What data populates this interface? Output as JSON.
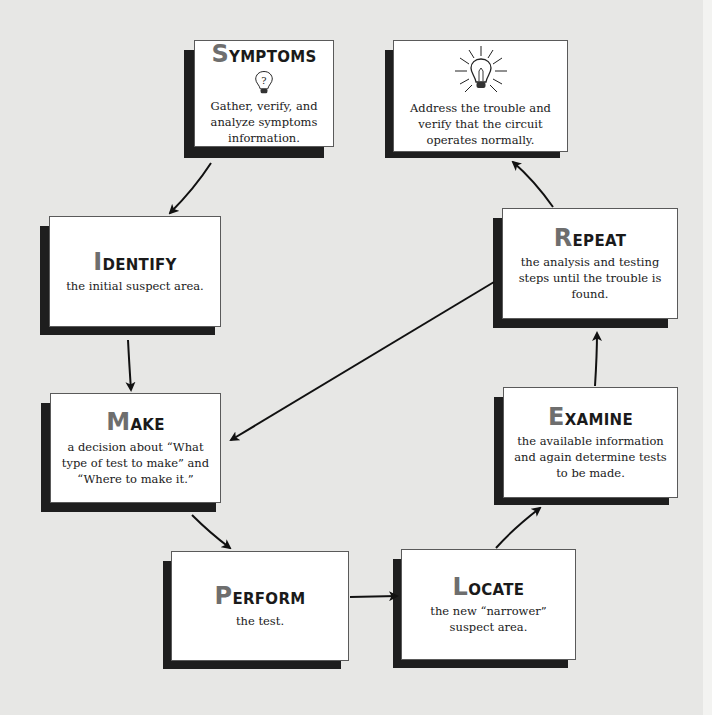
{
  "diagram": {
    "type": "troubleshooting-cycle",
    "colors": {
      "background": "#e7e7e5",
      "box_fill": "#ffffff",
      "box_shadow": "#1e1e1e",
      "title_initial": "#6e6e6e",
      "text": "#1a1a1a",
      "arrow": "#111111"
    },
    "nodes": {
      "symptoms": {
        "title_initial": "S",
        "title_rest": "YMPTOMS",
        "icon": "question-lightbulb-icon",
        "text": "Gather, verify, and analyze symptoms information."
      },
      "resolve": {
        "icon": "glowing-lightbulb-icon",
        "text": "Address the trouble and verify that the circuit operates normally."
      },
      "identify": {
        "title_initial": "I",
        "title_rest": "DENTIFY",
        "text": "the initial suspect area."
      },
      "repeat": {
        "title_initial": "R",
        "title_rest": "EPEAT",
        "text": "the analysis and testing steps until the trouble is found."
      },
      "make": {
        "title_initial": "M",
        "title_rest": "AKE",
        "text": "a decision about “What type of test to make” and “Where to make it.”"
      },
      "examine": {
        "title_initial": "E",
        "title_rest": "XAMINE",
        "text": "the available information and again determine tests to be made."
      },
      "perform": {
        "title_initial": "P",
        "title_rest": "ERFORM",
        "text": "the test."
      },
      "locate": {
        "title_initial": "L",
        "title_rest": "OCATE",
        "text": "the new “narrower” suspect area."
      }
    },
    "edges": [
      {
        "from": "symptoms",
        "to": "identify"
      },
      {
        "from": "identify",
        "to": "make"
      },
      {
        "from": "make",
        "to": "perform"
      },
      {
        "from": "perform",
        "to": "locate"
      },
      {
        "from": "locate",
        "to": "examine"
      },
      {
        "from": "examine",
        "to": "repeat"
      },
      {
        "from": "repeat",
        "to": "make"
      },
      {
        "from": "repeat",
        "to": "resolve"
      }
    ]
  }
}
